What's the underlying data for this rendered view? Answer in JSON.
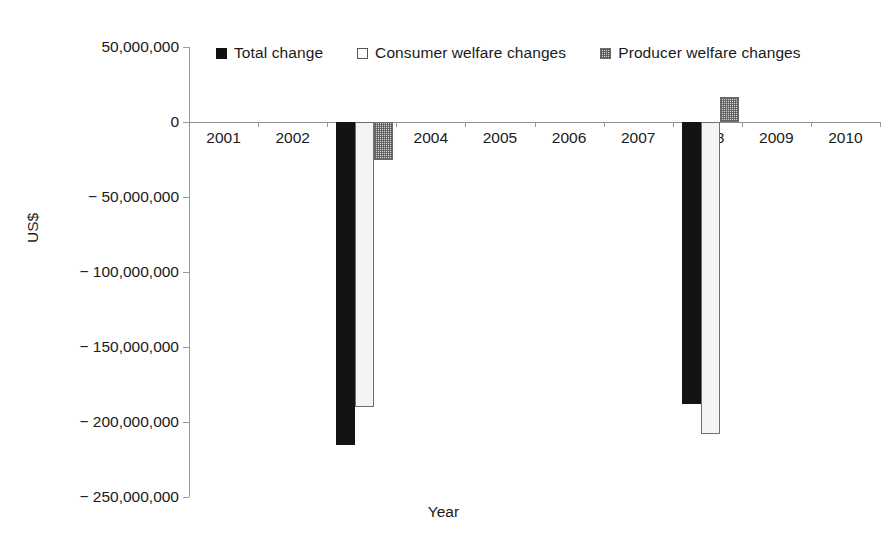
{
  "chart_data": {
    "type": "bar",
    "title": "",
    "xlabel": "Year",
    "ylabel": "US$",
    "categories": [
      "2001",
      "2002",
      "2003",
      "2004",
      "2005",
      "2006",
      "2007",
      "2008",
      "2009",
      "2010"
    ],
    "series": [
      {
        "name": "Total change",
        "color": "#131313",
        "values": [
          0,
          0,
          -215000000,
          0,
          0,
          0,
          0,
          -188000000,
          0,
          0
        ]
      },
      {
        "name": "Consumer welfare changes",
        "color": "#f4f4f4",
        "values": [
          0,
          0,
          -190000000,
          0,
          0,
          0,
          0,
          -208000000,
          0,
          0
        ]
      },
      {
        "name": "Producer welfare changes",
        "color": "#d4d4d4",
        "values": [
          0,
          0,
          -25000000,
          0,
          0,
          0,
          0,
          17000000,
          0,
          0
        ]
      }
    ],
    "ylim": [
      -250000000,
      50000000
    ],
    "ytick_values": [
      50000000,
      0,
      -50000000,
      -100000000,
      -150000000,
      -200000000,
      -250000000
    ],
    "ytick_labels": [
      "50,000,000",
      "0",
      "− 50,000,000",
      "− 100,000,000",
      "− 150,000,000",
      "− 200,000,000",
      "− 250,000,000"
    ],
    "grid": false,
    "legend_position": "top"
  },
  "axes": {
    "y_title": "US$",
    "x_title": "Year"
  },
  "legend": {
    "items": [
      {
        "label": "Total change",
        "marker": "filled-square-black"
      },
      {
        "label": "Consumer welfare changes",
        "marker": "open-square-white"
      },
      {
        "label": "Producer welfare changes",
        "marker": "hatched-square-gray"
      }
    ]
  }
}
